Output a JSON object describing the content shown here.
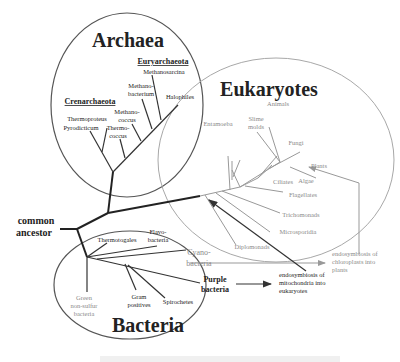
{
  "diagram": {
    "type": "phylogenetic tree of life",
    "root": {
      "label_line1": "common",
      "label_line2": "ancestor"
    },
    "domains": {
      "archaea": {
        "title": "Archaea",
        "groups": {
          "euryarchaeota": "Euryarchaeota",
          "crenarchaeota": "Crenarchaeota"
        },
        "leaves": {
          "methanosarcina": "Methanosarcina",
          "methanobacterium_1": "Methano-",
          "methanobacterium_2": "bacterium",
          "halophiles": "Halophiles",
          "methanococcus_1": "Methano-",
          "methanococcus_2": "coccus",
          "thermococcus_1": "Thermo-",
          "thermococcus_2": "coccus",
          "thermoproteus": "Thermoproteus",
          "pyrodicticum": "Pyrodicticum"
        }
      },
      "eukaryotes": {
        "title": "Eukaryotes",
        "leaves": {
          "animals": "Animals",
          "slime_molds_1": "Slime",
          "slime_molds_2": "molds",
          "entamoeba": "Entamoeba",
          "fungi": "Fungi",
          "plants": "Plants",
          "algae": "Algae",
          "ciliates": "Ciliates",
          "flagellates": "Flagellates",
          "trichomonads": "Trichomonads",
          "microsporidia": "Microsporidia",
          "diplomonads": "Diplomonads"
        }
      },
      "bacteria": {
        "title": "Bacteria",
        "leaves": {
          "thermotogales": "Thermotogales",
          "flavobacteria_1": "Flavo-",
          "flavobacteria_2": "bacteria",
          "cyanobacteria_1": "Cyano-",
          "cyanobacteria_2": "bacteria",
          "purple_bacteria_1": "Purple",
          "purple_bacteria_2": "bacteria",
          "green_nonsulfur_1": "Green",
          "green_nonsulfur_2": "non-sulfur",
          "green_nonsulfur_3": "bacteria",
          "gram_positives_1": "Gram",
          "gram_positives_2": "positives",
          "spirochetes": "Spirochetes"
        }
      }
    },
    "annotations": {
      "chloroplast_1": "endosymbiosis of",
      "chloroplast_2": "chloroplasts into",
      "chloroplast_3": "plants",
      "mitochondria_1": "endosymbiosis of",
      "mitochondria_2": "mitochondria into",
      "mitochondria_3": "eukaryotes"
    },
    "colors": {
      "dark_line": "#222222",
      "grey_line": "#9a9a9a",
      "circle_outline": "#555555",
      "euk_outline": "#a0a0a0"
    }
  }
}
